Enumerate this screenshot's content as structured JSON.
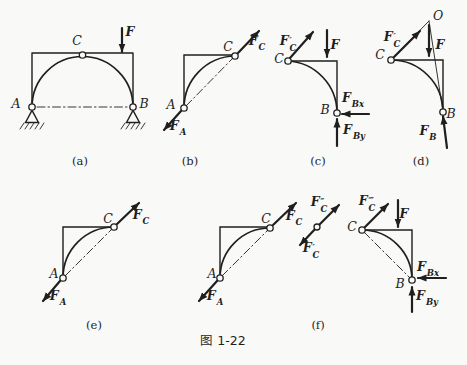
{
  "caption": "图 1-22",
  "colors": {
    "ink": "#1f1f1f",
    "paper": "#f9f9f7"
  },
  "figures": {
    "a": {
      "tag": "(a)",
      "label_a": "A",
      "label_b": "B",
      "label_c": "C",
      "force_f": "F"
    },
    "b": {
      "tag": "(b)",
      "label_a": "A",
      "label_c": "C",
      "force_fa": {
        "main": "F",
        "sub": "A"
      },
      "force_fc": {
        "main": "F",
        "sub": "C"
      }
    },
    "c": {
      "tag": "(c)",
      "label_b": "B",
      "label_c": "C",
      "force_f": "F",
      "force_fc_prime": {
        "main": "F",
        "sup": "′",
        "sub": "C"
      },
      "force_fbx": {
        "main": "F",
        "sub": "Bx"
      },
      "force_fby": {
        "main": "F",
        "sub": "By"
      }
    },
    "d": {
      "tag": "(d)",
      "label_o": "O",
      "label_b": "B",
      "label_c": "C",
      "force_f": "F",
      "force_fc_prime": {
        "main": "F",
        "sup": "′",
        "sub": "C"
      },
      "force_fb": {
        "main": "F",
        "sub": "B"
      }
    },
    "e": {
      "tag": "(e)",
      "label_a": "A",
      "label_c": "C",
      "force_fa": {
        "main": "F",
        "sub": "A"
      },
      "force_fc": {
        "main": "F",
        "sub": "C"
      }
    },
    "f": {
      "tag": "(f)",
      "label_a": "A",
      "label_c_left": "C",
      "label_c_right": "C",
      "label_b": "B",
      "force_fa": {
        "main": "F",
        "sub": "A"
      },
      "force_fc": {
        "main": "F",
        "sub": "C"
      },
      "force_fc_dprime": {
        "main": "F",
        "sup": "″",
        "sub": "C"
      },
      "force_fc_prime": {
        "main": "F",
        "sup": "′",
        "sub": "C"
      },
      "force_fc_tprime": {
        "main": "F",
        "sup": "‴",
        "sub": "C"
      },
      "force_f": "F",
      "force_fbx": {
        "main": "F",
        "sub": "Bx"
      },
      "force_fby": {
        "main": "F",
        "sub": "By"
      }
    }
  }
}
